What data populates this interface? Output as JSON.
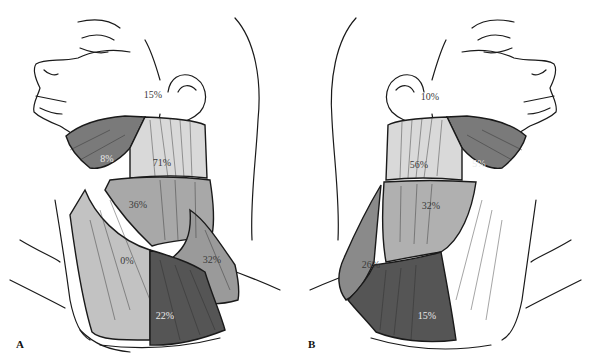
{
  "figure": {
    "panels": [
      {
        "letter": "A",
        "side": "right-lateral",
        "regions": [
          {
            "id": "parotid",
            "label": "15%",
            "x": 153,
            "y": 94,
            "tone": "dark"
          },
          {
            "id": "submandibular",
            "label": "8%",
            "x": 107,
            "y": 158,
            "tone": "light"
          },
          {
            "id": "upper-jugular",
            "label": "71%",
            "x": 162,
            "y": 162,
            "tone": "dark"
          },
          {
            "id": "mid-jugular",
            "label": "36%",
            "x": 138,
            "y": 204,
            "tone": "dark"
          },
          {
            "id": "posterior-triangle",
            "label": "0%",
            "x": 127,
            "y": 260,
            "tone": "dark"
          },
          {
            "id": "posterior-lower",
            "label": "32%",
            "x": 212,
            "y": 259,
            "tone": "dark"
          },
          {
            "id": "lower-jugular",
            "label": "22%",
            "x": 165,
            "y": 315,
            "tone": "light"
          }
        ]
      },
      {
        "letter": "B",
        "side": "left-lateral",
        "regions": [
          {
            "id": "parotid",
            "label": "10%",
            "x": 134,
            "y": 96,
            "tone": "dark"
          },
          {
            "id": "submandibular",
            "label": "5%",
            "x": 183,
            "y": 163,
            "tone": "light"
          },
          {
            "id": "upper-jugular",
            "label": "56%",
            "x": 123,
            "y": 164,
            "tone": "dark"
          },
          {
            "id": "mid-jugular",
            "label": "32%",
            "x": 135,
            "y": 205,
            "tone": "dark"
          },
          {
            "id": "posterior-triangle",
            "label": "26%",
            "x": 75,
            "y": 264,
            "tone": "dark"
          },
          {
            "id": "lower-jugular",
            "label": "15%",
            "x": 131,
            "y": 315,
            "tone": "light"
          }
        ]
      }
    ],
    "colors": {
      "line": "#1a1a1a",
      "light_zone": "#d9d9d9",
      "mid_zone": "#a8a8a8",
      "dark_zone": "#7a7a7a",
      "darkest_zone": "#555555"
    }
  }
}
